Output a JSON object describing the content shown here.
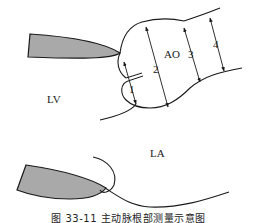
{
  "figure": {
    "caption": "图 33-11  主动脉根部测量示意图",
    "labels": {
      "lv": "LV",
      "ao": "AO",
      "la": "LA"
    },
    "measurements": [
      {
        "id": "1",
        "label": "1"
      },
      {
        "id": "2",
        "label": "2"
      },
      {
        "id": "3",
        "label": "3"
      },
      {
        "id": "4",
        "label": "4"
      }
    ],
    "colors": {
      "line": "#1a1a1a",
      "leaflet_fill": "#a9a9a9",
      "background": "#ffffff"
    }
  }
}
